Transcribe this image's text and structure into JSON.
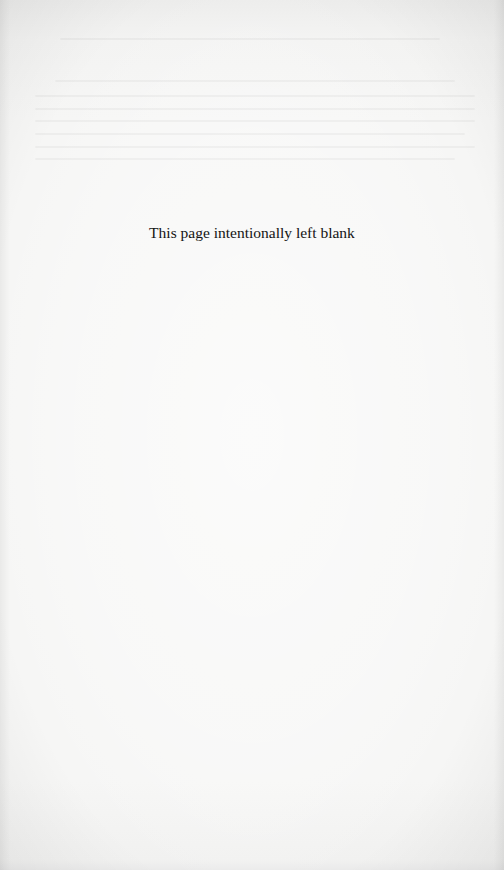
{
  "page": {
    "notice": "This page intentionally left blank",
    "background_color": "#f4f4f3",
    "text_color": "#141414"
  }
}
